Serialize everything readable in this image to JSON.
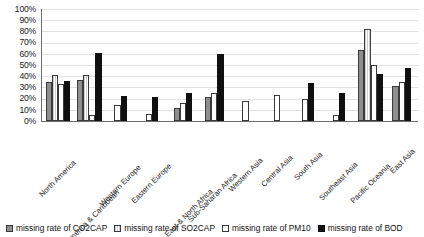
{
  "chart_data": {
    "type": "bar",
    "title": "",
    "xlabel": "",
    "ylabel": "",
    "ylim": [
      0,
      100
    ],
    "ytick_labels": [
      "100%",
      "90%",
      "80%",
      "70%",
      "60%",
      "50%",
      "40%",
      "30%",
      "20%",
      "10%",
      "0%"
    ],
    "ytick_values": [
      100,
      90,
      80,
      70,
      60,
      50,
      40,
      30,
      20,
      10,
      0
    ],
    "grid": true,
    "legend_position": "bottom",
    "categories": [
      "North America",
      "Latin America & Caribbean",
      "Western Europe",
      "Eastern Europe",
      "Middle East & North Africa",
      "Sub-Saharan Africa",
      "Western Asia",
      "Central Asia",
      "South Asia",
      "Southeast Asia",
      "Pacific Oceania",
      "East Asia"
    ],
    "series": [
      {
        "name": "missing rate of CO2CAP",
        "color": "#8e8e8e",
        "values": [
          35,
          37,
          0,
          0,
          12,
          21,
          0,
          0,
          0,
          0,
          63,
          31
        ]
      },
      {
        "name": "missing rate of SO2CAP",
        "color": "#cfcfcf",
        "values": [
          41,
          41,
          0,
          0,
          0,
          0,
          0,
          0,
          0,
          0,
          82,
          0
        ]
      },
      {
        "name": "missing rate of PM10",
        "color": "#ffffff",
        "values": [
          33,
          5,
          14,
          6,
          16,
          25,
          18,
          23,
          20,
          5,
          50,
          35
        ]
      },
      {
        "name": "missing rate of BOD",
        "color": "#101010",
        "values": [
          36,
          61,
          22,
          21,
          25,
          60,
          0,
          0,
          34,
          25,
          42,
          47
        ]
      }
    ],
    "bar_groups": [
      {
        "category": "North America",
        "bars": [
          {
            "series": "missing rate of CO2CAP",
            "value": 35
          },
          {
            "series": "missing rate of SO2CAP",
            "value": 41
          },
          {
            "series": "missing rate of PM10",
            "value": 33
          },
          {
            "series": "missing rate of BOD",
            "value": 36
          }
        ]
      },
      {
        "category": "Latin America & Caribbean",
        "bars": [
          {
            "series": "missing rate of CO2CAP",
            "value": 37
          },
          {
            "series": "missing rate of SO2CAP",
            "value": 41
          },
          {
            "series": "missing rate of PM10",
            "value": 5
          },
          {
            "series": "missing rate of BOD",
            "value": 61
          }
        ]
      },
      {
        "category": "Western Europe",
        "bars": [
          {
            "series": "missing rate of PM10",
            "value": 14
          },
          {
            "series": "missing rate of BOD",
            "value": 22
          }
        ]
      },
      {
        "category": "Eastern Europe",
        "bars": [
          {
            "series": "missing rate of PM10",
            "value": 6
          },
          {
            "series": "missing rate of BOD",
            "value": 21
          }
        ]
      },
      {
        "category": "Middle East & North Africa",
        "bars": [
          {
            "series": "missing rate of CO2CAP",
            "value": 12
          },
          {
            "series": "missing rate of PM10",
            "value": 16
          },
          {
            "series": "missing rate of BOD",
            "value": 25
          }
        ]
      },
      {
        "category": "Sub-Saharan Africa",
        "bars": [
          {
            "series": "missing rate of CO2CAP",
            "value": 21
          },
          {
            "series": "missing rate of PM10",
            "value": 25
          },
          {
            "series": "missing rate of BOD",
            "value": 60
          }
        ]
      },
      {
        "category": "Western Asia",
        "bars": [
          {
            "series": "missing rate of PM10",
            "value": 18
          }
        ]
      },
      {
        "category": "Central Asia",
        "bars": [
          {
            "series": "missing rate of PM10",
            "value": 23
          }
        ]
      },
      {
        "category": "South Asia",
        "bars": [
          {
            "series": "missing rate of PM10",
            "value": 20
          },
          {
            "series": "missing rate of BOD",
            "value": 34
          }
        ]
      },
      {
        "category": "Southeast Asia",
        "bars": [
          {
            "series": "missing rate of PM10",
            "value": 5
          },
          {
            "series": "missing rate of BOD",
            "value": 25
          }
        ]
      },
      {
        "category": "Pacific Oceania",
        "bars": [
          {
            "series": "missing rate of CO2CAP",
            "value": 63
          },
          {
            "series": "missing rate of SO2CAP",
            "value": 82
          },
          {
            "series": "missing rate of PM10",
            "value": 50
          },
          {
            "series": "missing rate of BOD",
            "value": 42
          }
        ]
      },
      {
        "category": "East Asia",
        "bars": [
          {
            "series": "missing rate of CO2CAP",
            "value": 31
          },
          {
            "series": "missing rate of PM10",
            "value": 35
          },
          {
            "series": "missing rate of BOD",
            "value": 47
          }
        ]
      }
    ]
  },
  "legend": {
    "items": [
      {
        "label": "missing rate of CO2CAP",
        "swatch": "series-0-swatch"
      },
      {
        "label": "missing rate of SO2CAP",
        "swatch": "series-1-swatch"
      },
      {
        "label": "missing rate of PM10",
        "swatch": "series-2-swatch"
      },
      {
        "label": "missing rate of BOD",
        "swatch": "series-3-swatch"
      }
    ]
  }
}
